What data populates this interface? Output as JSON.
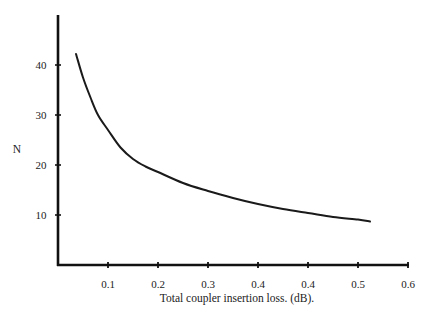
{
  "chart_data": {
    "type": "line",
    "title": "",
    "xlabel": "Total coupler insertion loss. (dB).",
    "ylabel": "N",
    "x_tick_labels": [
      "0.1",
      "0.2",
      "0.3",
      "0.4",
      "0.4",
      "0.5",
      "0.6"
    ],
    "x_tick_positions": [
      0.1,
      0.2,
      0.3,
      0.4,
      0.5,
      0.6,
      0.7
    ],
    "y_tick_labels": [
      "10",
      "20",
      "30",
      "40"
    ],
    "y_tick_positions": [
      10,
      20,
      30,
      40
    ],
    "xlim": [
      0,
      0.7
    ],
    "ylim": [
      0,
      50
    ],
    "grid": false,
    "legend": null,
    "series": [
      {
        "name": "N",
        "x": [
          0.036,
          0.05,
          0.065,
          0.08,
          0.1,
          0.125,
          0.15,
          0.175,
          0.2,
          0.25,
          0.3,
          0.35,
          0.4,
          0.45,
          0.5,
          0.55,
          0.6,
          0.624
        ],
        "y": [
          42.2,
          37.5,
          33.5,
          30.0,
          27.0,
          23.5,
          21.2,
          19.7,
          18.6,
          16.4,
          14.8,
          13.4,
          12.2,
          11.2,
          10.4,
          9.6,
          9.1,
          8.7
        ]
      }
    ],
    "colors": {
      "line": "#1a1a1a",
      "axis": "#111111",
      "text": "#222222"
    }
  }
}
